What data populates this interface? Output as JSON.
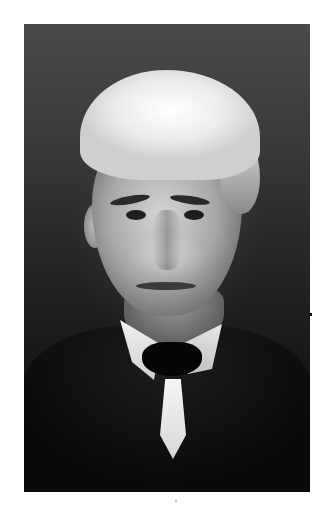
{
  "image": {
    "description": "Black-and-white portrait photograph of an elderly man with white hair, wearing a dark coat, white collar and dark tie",
    "colors": {
      "page_background": "#ffffff",
      "photo_background_top": "#4a4a4a",
      "photo_background_bottom": "#0e0e0e",
      "hair": "#ececec",
      "coat": "#0a0a0a",
      "collar": "#f2f2f2"
    }
  }
}
